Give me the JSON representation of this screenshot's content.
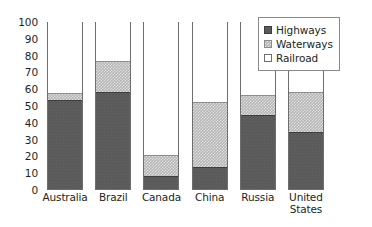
{
  "chart_data": {
    "type": "bar",
    "subtype": "stacked-bar-100",
    "title": "",
    "subtitle": "",
    "xlabel": "",
    "ylabel": "",
    "ylim": [
      0,
      100
    ],
    "yticks": [
      0,
      10,
      20,
      30,
      40,
      50,
      60,
      70,
      80,
      90,
      100
    ],
    "ytick_labels": [
      "0",
      "10",
      "20",
      "30",
      "40",
      "50",
      "60",
      "70",
      "80",
      "90",
      "100"
    ],
    "grid": false,
    "legend_position": "top-right",
    "categories": [
      "Australia",
      "Brazil",
      "Canada",
      "China",
      "Russia",
      "United States"
    ],
    "series": [
      {
        "name": "Highways",
        "color": "#5a5a5a",
        "values": [
          53,
          58,
          8,
          13,
          44,
          34
        ]
      },
      {
        "name": "Waterways",
        "color": "#b5b5b5",
        "values": [
          4,
          18,
          12,
          39,
          12,
          24
        ]
      },
      {
        "name": "Railroad",
        "color": "#ffffff",
        "values": [
          43,
          24,
          80,
          48,
          44,
          42
        ]
      }
    ],
    "annotations": []
  },
  "yaxis": {
    "ticks": [
      {
        "label": "100"
      },
      {
        "label": "90"
      },
      {
        "label": "80"
      },
      {
        "label": "70"
      },
      {
        "label": "60"
      },
      {
        "label": "50"
      },
      {
        "label": "40"
      },
      {
        "label": "30"
      },
      {
        "label": "20"
      },
      {
        "label": "10"
      },
      {
        "label": "0"
      }
    ]
  },
  "xaxis": {
    "ticks": [
      {
        "label": "Australia"
      },
      {
        "label": "Brazil"
      },
      {
        "label": "Canada"
      },
      {
        "label": "China"
      },
      {
        "label": "Russia"
      },
      {
        "label": "United States"
      }
    ]
  },
  "legend": {
    "entries": [
      {
        "label": "Highways",
        "swatch": "highways-swatch-icon"
      },
      {
        "label": "Waterways",
        "swatch": "waterways-swatch-icon"
      },
      {
        "label": "Railroad",
        "swatch": "railroad-swatch-icon"
      }
    ]
  }
}
